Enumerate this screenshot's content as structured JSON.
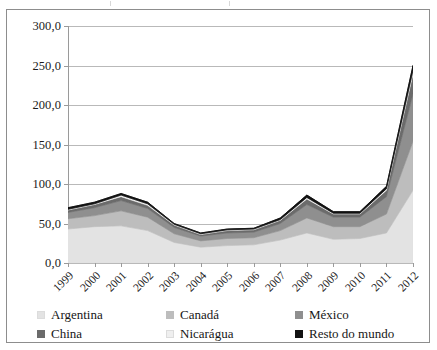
{
  "chart_data": {
    "type": "area",
    "stacked": true,
    "title": "",
    "subtitle": "",
    "xlabel": "",
    "ylabel": "",
    "grid": true,
    "legend_position": "bottom",
    "ylim": [
      0,
      300
    ],
    "ytick_labels": [
      "300,0",
      "250,0",
      "200,0",
      "150,0",
      "100,0",
      "50,0",
      "0,0"
    ],
    "ytick_values": [
      300,
      250,
      200,
      150,
      100,
      50,
      0
    ],
    "categories": [
      "1999",
      "2000",
      "2001",
      "2002",
      "2003",
      "2004",
      "2005",
      "2006",
      "2007",
      "2008",
      "2009",
      "2010",
      "2011",
      "2012"
    ],
    "series": [
      {
        "name": "Argentina",
        "color": "#e3e3e3",
        "values": [
          43,
          46,
          47,
          41,
          26,
          20,
          22,
          23,
          29,
          38,
          30,
          31,
          38,
          92
        ]
      },
      {
        "name": "Canadá",
        "color": "#bdbdbd",
        "values": [
          13,
          14,
          19,
          17,
          11,
          8,
          9,
          9,
          12,
          19,
          16,
          15,
          24,
          62
        ]
      },
      {
        "name": "México",
        "color": "#8f8f8f",
        "values": [
          8,
          10,
          13,
          11,
          8,
          6,
          7,
          7,
          9,
          17,
          12,
          12,
          22,
          60
        ]
      },
      {
        "name": "China",
        "color": "#6b6b6b",
        "values": [
          3,
          4,
          5,
          4,
          3,
          2,
          3,
          3,
          4,
          7,
          4,
          4,
          8,
          25
        ]
      },
      {
        "name": "Nicarágua",
        "color": "#efefef",
        "values": [
          1,
          1,
          2,
          2,
          1,
          1,
          1,
          1,
          1,
          2,
          1,
          1,
          2,
          5
        ]
      },
      {
        "name": "Resto do mundo",
        "color": "#121212",
        "values": [
          2,
          2,
          2,
          2,
          1,
          1,
          1,
          1,
          2,
          3,
          2,
          2,
          3,
          6
        ]
      }
    ],
    "totals": [
      70,
      77,
      88,
      77,
      50,
      38,
      43,
      44,
      57,
      86,
      65,
      65,
      97,
      250
    ]
  },
  "legend": {
    "rows": [
      [
        {
          "label": "Argentina",
          "color": "#e3e3e3"
        },
        {
          "label": "Canadá",
          "color": "#bdbdbd"
        },
        {
          "label": "México",
          "color": "#8f8f8f"
        }
      ],
      [
        {
          "label": "China",
          "color": "#6b6b6b"
        },
        {
          "label": "Nicarágua",
          "color": "#efefef"
        },
        {
          "label": "Resto do mundo",
          "color": "#121212"
        }
      ]
    ]
  }
}
